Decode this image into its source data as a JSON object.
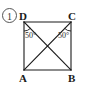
{
  "figure": {
    "item_number": "1",
    "shape": "rectangle-with-diagonals",
    "stroke_color": "#1a1a1a",
    "background_color": "#ffffff",
    "vertices": [
      {
        "name": "D",
        "label": "D",
        "position": "top-left",
        "x": 24,
        "y": 22
      },
      {
        "name": "C",
        "label": "C",
        "position": "top-right",
        "x": 71,
        "y": 22
      },
      {
        "name": "A",
        "label": "A",
        "position": "bottom-left",
        "x": 24,
        "y": 70
      },
      {
        "name": "B",
        "label": "B",
        "position": "bottom-right",
        "x": 71,
        "y": 70
      }
    ],
    "edges": [
      {
        "name": "DA",
        "from": "D",
        "to": "A"
      },
      {
        "name": "AB",
        "from": "A",
        "to": "B"
      },
      {
        "name": "BC",
        "from": "B",
        "to": "C"
      },
      {
        "name": "CD",
        "from": "C",
        "to": "D"
      }
    ],
    "diagonals": [
      {
        "name": "DB",
        "from": "D",
        "to": "B"
      },
      {
        "name": "CA",
        "from": "C",
        "to": "A"
      }
    ],
    "intersection": {
      "name": "center",
      "x": 47.5,
      "y": 46
    },
    "angles": [
      {
        "name": "angle-at-D",
        "vertex": "D",
        "between": "DA-DB",
        "label": "50°",
        "value": 50
      },
      {
        "name": "angle-at-C",
        "vertex": "C",
        "between": "CB-CA",
        "label": "50°",
        "value": 50
      }
    ]
  }
}
